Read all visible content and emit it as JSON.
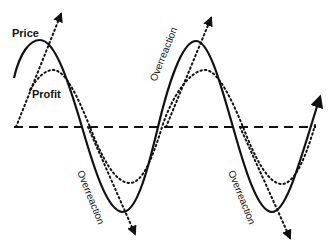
{
  "diagram": {
    "labels": {
      "price": "Price",
      "profit": "Profit",
      "overreaction_up_1": "Overreaction",
      "overreaction_down_1": "Overreaction",
      "overreaction_down_2": "Overreaction"
    },
    "colors": {
      "line": "#111111",
      "background": "#ffffff"
    },
    "series": [
      {
        "name": "Price",
        "style": "solid"
      },
      {
        "name": "Profit",
        "style": "dotted"
      },
      {
        "name": "Baseline",
        "style": "dashed"
      },
      {
        "name": "Overreaction trend arrows",
        "style": "dotted-arrow"
      }
    ]
  }
}
